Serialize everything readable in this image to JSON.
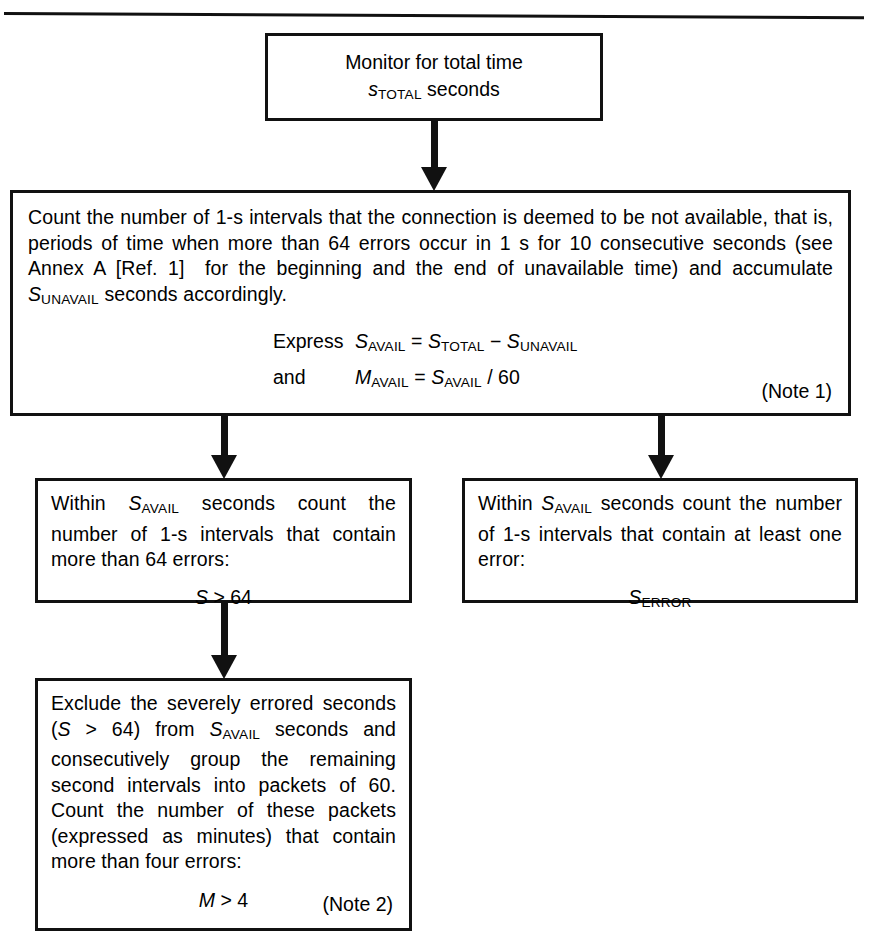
{
  "figure": {
    "type": "flowchart",
    "orientation": "top-down",
    "boxes": [
      {
        "id": "monitor",
        "lines": [
          "Monitor for total time",
          "s_TOTAL seconds"
        ]
      },
      {
        "id": "count-unavailable",
        "paragraph": "Count the number of 1-s intervals that the connection is deemed to be not available, that is, periods of time when more than 64 errors occur in 1 s for 10 consecutive seconds (see Annex A [Ref. 1]  for the beginning and the end of unavailable time) and accumulate S_UNAVAIL seconds accordingly.",
        "formula_1": "Express S_AVAIL = S_TOTAL − S_UNAVAIL",
        "formula_2": "and      M_AVAIL = S_AVAIL / 60",
        "note": "(Note 1)"
      },
      {
        "id": "severely-errored-seconds",
        "paragraph": "Within S_AVAIL seconds count the number of 1-s intervals that contain more than 64 errors:",
        "formula": "S > 64"
      },
      {
        "id": "errored-seconds",
        "paragraph": "Within S_AVAIL seconds count the number of 1-s intervals that contain at least one error:",
        "formula": "S_ERROR"
      },
      {
        "id": "errored-minutes",
        "paragraph": "Exclude the severely errored seconds (S > 64) from S_AVAIL seconds and consecutively group the remaining second intervals into packets of 60. Count the number of these packets (expressed as minutes) that contain more than four errors:",
        "formula": "M > 4",
        "note": "(Note 2)"
      }
    ]
  },
  "monitor": {
    "line1": "Monitor for total time",
    "var_s": "s",
    "sub_total": "TOTAL",
    "word_seconds": "seconds"
  },
  "count": {
    "t1": "Count the number of 1-s intervals that the connection is deemed to be not available, that is, periods of time when more than 64 errors occur in 1 s for 10 consecutive seconds (see Annex A [Ref. 1]  for the beginning and the end of unavailable time) and accumulate ",
    "var_S": "S",
    "sub_unavail": "UNAVAIL",
    "t2": " seconds accordingly.",
    "express_word": "Express",
    "and_word": "and",
    "eq_s_avail": "S",
    "sub_avail": "AVAIL",
    "eq_sign": "=",
    "eq_s_total": "S",
    "sub_total": "TOTAL",
    "minus_sign": "−",
    "eq_s_unavail": "S",
    "sub_unavail2": "UNAVAIL",
    "eq_m_avail": "M",
    "sub_avail2": "AVAIL",
    "eq_sign2": "=",
    "eq_s_avail2": "S",
    "sub_avail3": "AVAIL",
    "div_60": "/ 60",
    "note": "(Note 1)"
  },
  "severe": {
    "t1": "Within ",
    "var_S": "S",
    "sub_avail": "AVAIL",
    "t2": " seconds count the number of 1-s intervals that contain more than 64 errors:",
    "formula_var": "S",
    "formula_rest": "> 64"
  },
  "errored": {
    "t1": "Within ",
    "var_S": "S",
    "sub_avail": "AVAIL",
    "t2": " seconds count the number of 1-s intervals that contain at least one error:",
    "formula_var": "S",
    "formula_sub": "ERROR"
  },
  "minutes": {
    "t1": "Exclude the severely errored seconds (",
    "var_S1": "S",
    "t2": " > 64) from ",
    "var_S2": "S",
    "sub_avail": "AVAIL",
    "t3": " seconds and consecutively group the remaining second intervals into packets of 60. Count the number of these packets (expressed as minutes) that contain more than four errors:",
    "formula_var": "M",
    "formula_rest": "> 4",
    "note": "(Note 2)"
  }
}
